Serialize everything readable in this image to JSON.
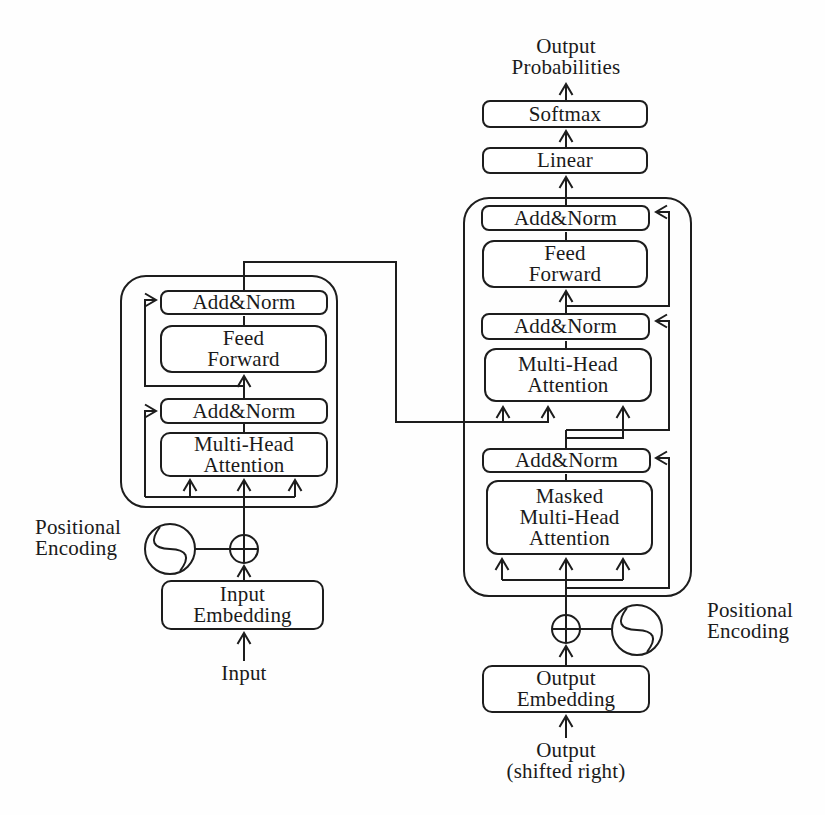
{
  "figure": {
    "colors": {
      "ink": "#1d1d1d",
      "background": "#fefefe",
      "box_fill": "#ffffff"
    },
    "output_probabilities": "Output\nProbabilities",
    "softmax": "Softmax",
    "linear": "Linear",
    "encoder": {
      "add_norm_top": "Add&Norm",
      "feed_forward": "Feed\nForward",
      "add_norm_bottom": "Add&Norm",
      "multi_head_attention": "Multi-Head\nAttention",
      "input_embedding": "Input\nEmbedding",
      "positional_encoding": "Positional\nEncoding",
      "input": "Input"
    },
    "decoder": {
      "add_norm_top": "Add&Norm",
      "feed_forward": "Feed\nForward",
      "add_norm_middle": "Add&Norm",
      "multi_head_attention": "Multi-Head\nAttention",
      "add_norm_bottom": "Add&Norm",
      "masked_multi_head_attention": "Masked\nMulti-Head\nAttention",
      "output_embedding": "Output\nEmbedding",
      "positional_encoding": "Positional\nEncoding",
      "output": "Output\n(shifted right)"
    }
  }
}
